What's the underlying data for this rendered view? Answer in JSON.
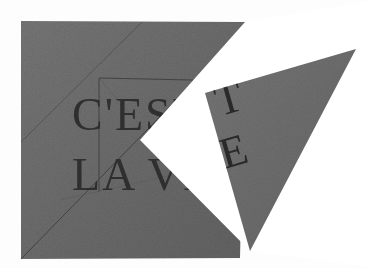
{
  "artwork": {
    "title": "C'EST LA VIE",
    "medium_description": "Two grey stone-like geometric panels with engraved Roman capital lettering",
    "background_color": "#fdfdfd",
    "stone_color": "#6e6e6e",
    "stone_color_dark": "#5e5e5e",
    "stone_color_light": "#7d7d7d",
    "engraving_color": "#2a2a2a",
    "wedge_color": "#ffffff"
  },
  "inscription": {
    "full_text": "C'EST LA VIE",
    "left_panel_lines": [
      {
        "id": "line-1",
        "text": "C'EST"
      },
      {
        "id": "line-2",
        "text": "LA VI"
      }
    ],
    "right_panel_letters": [
      {
        "id": "letter-t",
        "text": "T"
      },
      {
        "id": "letter-e",
        "text": "E"
      }
    ]
  },
  "shapes": {
    "left_panel": {
      "name": "left-stone-panel",
      "fill": "#6e6e6e",
      "points": "21,21 245,22 240,258 21,259"
    },
    "left_panel_notch": {
      "name": "white-wedge-notch",
      "fill": "#ffffff",
      "points": "245,22 140,140 250,251 377,268 377,0"
    },
    "right_triangle": {
      "name": "right-stone-triangle",
      "fill": "#6e6e6e",
      "points": "205,93 356,49 250,251"
    },
    "construction_lines": [
      {
        "name": "diagonal-upper-right",
        "x1": 100,
        "y1": 78,
        "x2": 192,
        "y2": 79
      },
      {
        "name": "diagonal-long-lower",
        "x1": 21,
        "y1": 259,
        "x2": 185,
        "y2": 90
      },
      {
        "name": "vertical-left-rule",
        "x1": 99,
        "y1": 78,
        "x2": 99,
        "y2": 192
      },
      {
        "name": "diagonal-top-left",
        "x1": 21,
        "y1": 140,
        "x2": 140,
        "y2": 22
      },
      {
        "name": "diagonal-bottom-edge",
        "x1": 21,
        "y1": 259,
        "x2": 240,
        "y2": 258
      }
    ]
  },
  "labels": {
    "canvas_label": "Artwork canvas",
    "left_panel_label": "Left stone panel",
    "right_panel_label": "Right stone triangle",
    "wedge_label": "White wedge cut-out"
  }
}
